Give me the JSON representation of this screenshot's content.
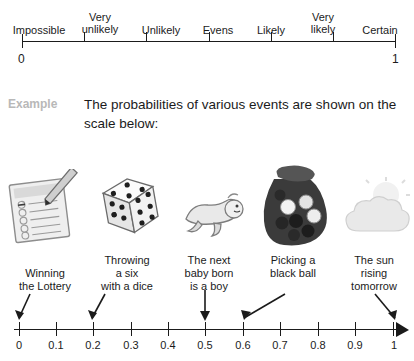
{
  "top_scale": {
    "words": [
      "Impossible",
      "Very\nunlikely",
      "Unlikely",
      "Evens",
      "Likely",
      "Very\nlikely",
      "Certain"
    ],
    "left_end_label": "0",
    "right_end_label": "1"
  },
  "example": {
    "tag": "Example",
    "text": "The probabilities of various events are shown on the scale below:"
  },
  "events": [
    {
      "icon": "lottery-ticket-icon",
      "caption": "Winning\nthe Lottery",
      "probability": 0.0
    },
    {
      "icon": "dice-icon",
      "caption": "Throwing\na six\nwith a dice",
      "probability": 0.17
    },
    {
      "icon": "baby-icon",
      "caption": "The next\nbaby born\nis a boy",
      "probability": 0.5
    },
    {
      "icon": "bag-of-balls-icon",
      "caption": "Picking a\nblack ball",
      "probability": 0.6
    },
    {
      "icon": "sun-cloud-icon",
      "caption": "The sun\nrising\ntomorrow",
      "probability": 1.0
    }
  ],
  "bottom_scale": {
    "ticks": [
      "0",
      "0.1",
      "0.2",
      "0.3",
      "0.4",
      "0.5",
      "0.6",
      "0.7",
      "0.8",
      "0.9",
      "1"
    ]
  },
  "colors": {
    "ink": "#1b1b1b",
    "example_tag": "#b8b8b8",
    "paper": "#ffffff"
  }
}
